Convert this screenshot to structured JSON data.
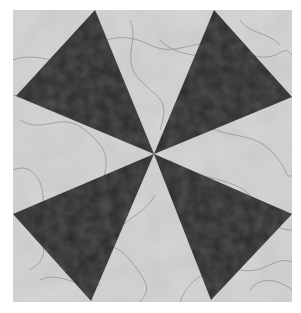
{
  "image": {
    "subject": "quilt block with four dark triangular blades on a light marbled background",
    "bounds": {
      "x": 13,
      "y": 10,
      "width": 279,
      "height": 292
    },
    "center": {
      "x": 154,
      "y": 154
    },
    "colors": {
      "background": "#ffffff",
      "light_fabric": "#c9c9c9",
      "light_fabric_highlight": "#dcdcdc",
      "dark_fabric": "#2e2e2e",
      "dark_fabric_highlight": "#444444",
      "veins": "#8a8a8a"
    },
    "blades": [
      {
        "name": "top-left",
        "points": "95,10 16,96 154,154"
      },
      {
        "name": "top-right",
        "points": "214,10 292,97 154,154"
      },
      {
        "name": "bottom-right",
        "points": "292,214 211,300 154,154"
      },
      {
        "name": "bottom-left",
        "points": "13,214 91,301 154,154"
      }
    ]
  }
}
